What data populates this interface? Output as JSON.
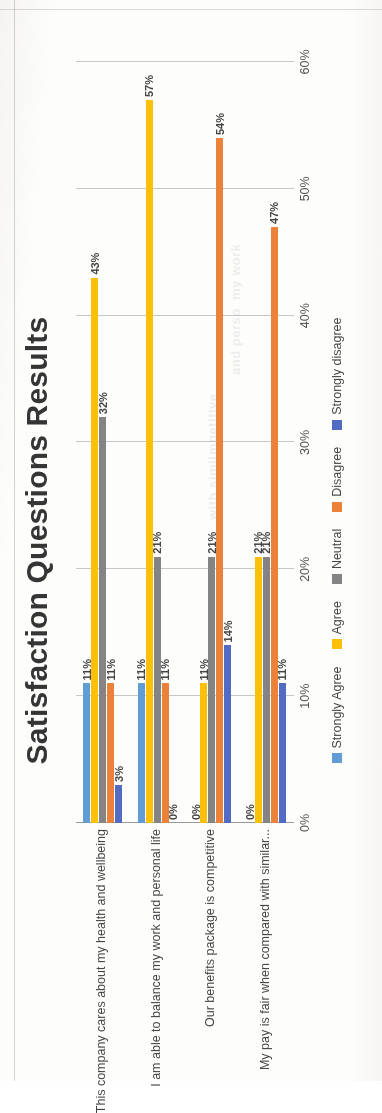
{
  "document": {
    "kind": "scanned-chart-page",
    "orientation_note": "chart printed sideways on the page"
  },
  "chart_data": {
    "type": "bar",
    "orientation": "horizontal",
    "title": "Satisfaction Questions Results",
    "xlabel": "",
    "ylabel": "",
    "xlim": [
      0,
      0.6
    ],
    "grid": true,
    "legend_position": "bottom",
    "tick_labels": [
      "0%",
      "10%",
      "20%",
      "30%",
      "40%",
      "50%",
      "60%"
    ],
    "tick_values": [
      0,
      10,
      20,
      30,
      40,
      50,
      60
    ],
    "categories": [
      "This company cares about my health and wellbeing",
      "I am able to balance my work and personal life",
      "Our benefits package is competitive",
      "My pay is fair when compared with similar..."
    ],
    "series": [
      {
        "name": "Strongly Agree",
        "color": "#5b9bd5",
        "values": [
          11,
          11,
          0,
          0
        ],
        "labels": [
          "11%",
          "11%",
          "0%",
          "0%"
        ]
      },
      {
        "name": "Agree",
        "color": "#ffc000",
        "values": [
          43,
          57,
          11,
          21
        ],
        "labels": [
          "43%",
          "57%",
          "11%",
          "21%"
        ]
      },
      {
        "name": "Neutral",
        "color": "#808080",
        "values": [
          32,
          21,
          21,
          21
        ],
        "labels": [
          "32%",
          "21%",
          "21%",
          "21%"
        ]
      },
      {
        "name": "Disagree",
        "color": "#ed7d31",
        "values": [
          11,
          11,
          54,
          47
        ],
        "labels": [
          "11%",
          "11%",
          "54%",
          "47%"
        ]
      },
      {
        "name": "Strongly disagree",
        "color": "#4a66c0",
        "values": [
          3,
          0,
          14,
          11
        ],
        "labels": [
          "3%",
          "0%",
          "14%",
          "11%"
        ]
      }
    ]
  },
  "ghost_text": [
    "my work",
    "and perso",
    "mpetitive",
    "with simil"
  ]
}
